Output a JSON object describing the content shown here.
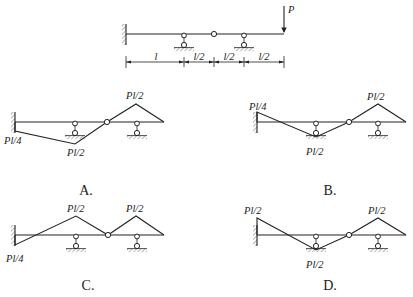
{
  "figure": {
    "problem_beam": {
      "load_label": "P",
      "dimensions": [
        "l",
        "l/2",
        "l/2",
        "l/2"
      ]
    },
    "options": [
      {
        "key": "A",
        "label": "A.",
        "moment_labels": {
          "fixed_end": "Pl/4",
          "support_1": "Pl/2",
          "support_2_peak": "Pl/2"
        }
      },
      {
        "key": "B",
        "label": "B.",
        "moment_labels": {
          "fixed_end": "Pl/4",
          "support_1": "Pl/2",
          "support_2_peak": "Pl/2"
        }
      },
      {
        "key": "C",
        "label": "C.",
        "moment_labels": {
          "fixed_end": "Pl/4",
          "support_1": "Pl/2",
          "support_2_peak": "Pl/2"
        }
      },
      {
        "key": "D",
        "label": "D.",
        "moment_labels": {
          "fixed_end": "Pl/2",
          "support_1": "Pl/2",
          "support_2_peak": "Pl/2"
        }
      }
    ]
  }
}
